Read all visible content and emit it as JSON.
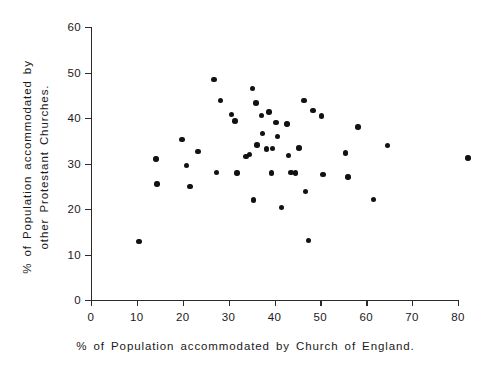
{
  "chart_data": {
    "type": "scatter",
    "title": "",
    "xlabel": "% of Population accommodated by Church of England.",
    "ylabel_line1": "% of Population accommodated by",
    "ylabel_line2": "other Protestant Churches.",
    "xlim": [
      0,
      80
    ],
    "ylim": [
      0,
      60
    ],
    "xticks": [
      0,
      10,
      20,
      30,
      40,
      50,
      60,
      70,
      80
    ],
    "yticks": [
      0,
      10,
      20,
      30,
      40,
      50,
      60
    ],
    "grid": false,
    "legend": null,
    "marker": "filled-circle",
    "marker_color": "#121212",
    "axis_color": "#2b2b2b",
    "points": [
      {
        "x": 10.5,
        "y": 12.9
      },
      {
        "x": 14.2,
        "y": 31.0
      },
      {
        "x": 14.4,
        "y": 25.5
      },
      {
        "x": 19.8,
        "y": 35.3
      },
      {
        "x": 20.8,
        "y": 29.6
      },
      {
        "x": 21.6,
        "y": 25.0
      },
      {
        "x": 23.3,
        "y": 32.7
      },
      {
        "x": 26.8,
        "y": 48.4
      },
      {
        "x": 27.3,
        "y": 28.0
      },
      {
        "x": 28.2,
        "y": 43.8
      },
      {
        "x": 30.6,
        "y": 40.8
      },
      {
        "x": 31.4,
        "y": 39.3
      },
      {
        "x": 31.8,
        "y": 27.9
      },
      {
        "x": 33.8,
        "y": 31.5
      },
      {
        "x": 34.6,
        "y": 32.0
      },
      {
        "x": 35.2,
        "y": 46.5
      },
      {
        "x": 35.4,
        "y": 22.0
      },
      {
        "x": 36.0,
        "y": 43.3
      },
      {
        "x": 36.2,
        "y": 34.1
      },
      {
        "x": 37.1,
        "y": 40.5
      },
      {
        "x": 37.4,
        "y": 36.6
      },
      {
        "x": 38.2,
        "y": 33.2
      },
      {
        "x": 38.8,
        "y": 41.3
      },
      {
        "x": 39.3,
        "y": 27.9
      },
      {
        "x": 39.6,
        "y": 33.3
      },
      {
        "x": 40.3,
        "y": 39.0
      },
      {
        "x": 40.6,
        "y": 36.0
      },
      {
        "x": 41.5,
        "y": 20.3
      },
      {
        "x": 42.7,
        "y": 38.7
      },
      {
        "x": 43.0,
        "y": 31.8
      },
      {
        "x": 43.6,
        "y": 28.0
      },
      {
        "x": 44.6,
        "y": 27.9
      },
      {
        "x": 45.3,
        "y": 33.4
      },
      {
        "x": 46.4,
        "y": 43.9
      },
      {
        "x": 46.8,
        "y": 23.8
      },
      {
        "x": 47.4,
        "y": 13.1
      },
      {
        "x": 48.4,
        "y": 41.7
      },
      {
        "x": 50.2,
        "y": 40.4
      },
      {
        "x": 50.6,
        "y": 27.6
      },
      {
        "x": 55.5,
        "y": 32.3
      },
      {
        "x": 56.0,
        "y": 27.0
      },
      {
        "x": 58.2,
        "y": 38.0
      },
      {
        "x": 61.6,
        "y": 22.1
      },
      {
        "x": 64.6,
        "y": 33.9
      },
      {
        "x": 82.2,
        "y": 31.2
      }
    ]
  }
}
